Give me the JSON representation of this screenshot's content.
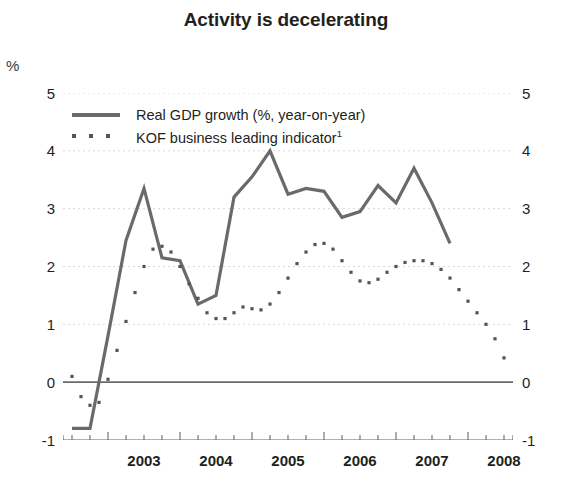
{
  "chart_data": {
    "type": "line",
    "title": "Activity is decelerating",
    "unit_label": "%",
    "xlabel": "",
    "ylabel": "%",
    "ylim": [
      -1,
      5
    ],
    "yticks": [
      -1,
      0,
      1,
      2,
      3,
      4,
      5
    ],
    "ytick_labels_left": [
      "5",
      "4",
      "3",
      "2",
      "1",
      "0",
      "-1"
    ],
    "ytick_labels_right": [
      "5",
      "4",
      "3",
      "2",
      "1",
      "0",
      "-1"
    ],
    "xlim": [
      2002.375,
      2008.625
    ],
    "xticks": [
      2003,
      2004,
      2005,
      2006,
      2007,
      2008
    ],
    "xtick_labels": [
      "2003",
      "2004",
      "2005",
      "2006",
      "2007",
      "2008"
    ],
    "minor_xticks_per_year": 4,
    "grid": true,
    "grid_color": "#d8d8d8",
    "zero_line_color": "#6b6b6b",
    "legend_position": "upper-left-inside",
    "series": [
      {
        "name": "Real GDP growth (%, year-on-year)",
        "style": "solid",
        "color": "#6a6a6a",
        "x": [
          2002.5,
          2002.75,
          2003.0,
          2003.25,
          2003.5,
          2003.75,
          2004.0,
          2004.25,
          2004.5,
          2004.75,
          2005.0,
          2005.25,
          2005.5,
          2005.75,
          2006.0,
          2006.25,
          2006.5,
          2006.75,
          2007.0,
          2007.25,
          2007.5,
          2007.75
        ],
        "values": [
          -0.8,
          -0.8,
          0.8,
          2.45,
          3.35,
          2.15,
          2.1,
          1.35,
          1.5,
          3.2,
          3.55,
          4.0,
          3.25,
          3.35,
          3.3,
          2.85,
          2.95,
          3.4,
          3.1,
          3.7,
          3.1,
          2.4
        ]
      },
      {
        "name": "KOF business leading indicator¹",
        "style": "dotted",
        "color": "#555555",
        "x": [
          2002.5,
          2002.625,
          2002.75,
          2002.875,
          2003.0,
          2003.125,
          2003.25,
          2003.375,
          2003.5,
          2003.625,
          2003.75,
          2003.875,
          2004.0,
          2004.125,
          2004.25,
          2004.375,
          2004.5,
          2004.625,
          2004.75,
          2004.875,
          2005.0,
          2005.125,
          2005.25,
          2005.375,
          2005.5,
          2005.625,
          2005.75,
          2005.875,
          2006.0,
          2006.125,
          2006.25,
          2006.375,
          2006.5,
          2006.625,
          2006.75,
          2006.875,
          2007.0,
          2007.125,
          2007.25,
          2007.375,
          2007.5,
          2007.625,
          2007.75,
          2007.875,
          2008.0,
          2008.125,
          2008.25,
          2008.375,
          2008.5
        ],
        "values": [
          0.1,
          -0.25,
          -0.4,
          -0.35,
          0.05,
          0.55,
          1.05,
          1.55,
          2.0,
          2.3,
          2.35,
          2.25,
          2.0,
          1.7,
          1.45,
          1.2,
          1.1,
          1.1,
          1.2,
          1.3,
          1.27,
          1.25,
          1.35,
          1.55,
          1.8,
          2.05,
          2.25,
          2.38,
          2.4,
          2.3,
          2.1,
          1.9,
          1.75,
          1.72,
          1.78,
          1.9,
          2.0,
          2.07,
          2.1,
          2.1,
          2.05,
          1.95,
          1.8,
          1.6,
          1.4,
          1.2,
          1.0,
          0.75,
          0.42
        ]
      }
    ]
  },
  "legend": {
    "items": [
      {
        "label": "Real GDP growth (%, year-on-year)",
        "style": "solid"
      },
      {
        "label": "KOF business leading indicator",
        "style": "dotted",
        "superscript": "1"
      }
    ]
  }
}
